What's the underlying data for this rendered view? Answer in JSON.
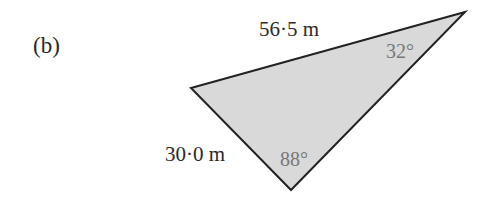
{
  "part_label": "(b)",
  "triangle": {
    "fill": "#d9d9d9",
    "stroke": "#222222",
    "vertices": [
      [
        191,
        88
      ],
      [
        465,
        12
      ],
      [
        291,
        190
      ]
    ]
  },
  "sides": {
    "top": "56·5 m",
    "left": "30·0 m"
  },
  "angles": {
    "right": "32°",
    "bottom": "88°"
  }
}
